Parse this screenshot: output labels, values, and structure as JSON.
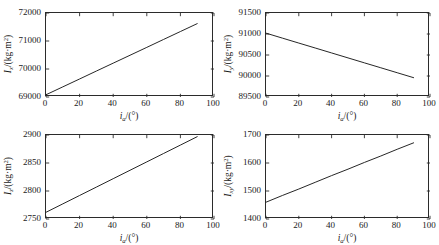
{
  "figure": {
    "background": "#ffffff",
    "line_color": "#1a1a1a",
    "axis_color": "#2b2b2b",
    "panel_count": 4
  },
  "chart_data": [
    {
      "type": "line",
      "panel": "top-left",
      "title": "",
      "xlabel_parts": {
        "symbol": "i",
        "subscript": "a",
        "unit": "/(°)"
      },
      "ylabel_parts": {
        "symbol": "I",
        "subscript": "x",
        "unit": "/(kg·m",
        "exponent": "2",
        "unit_close": ")"
      },
      "xlabel": "i_a/(°)",
      "ylabel": "I_x/(kg·m²)",
      "xlim": [
        0,
        100
      ],
      "ylim": [
        69000,
        72000
      ],
      "xticks": [
        0,
        20,
        40,
        60,
        80,
        100
      ],
      "yticks": [
        69000,
        70000,
        71000,
        72000
      ],
      "xticklabels": [
        "0",
        "20",
        "40",
        "60",
        "80",
        "100"
      ],
      "yticklabels": [
        "69000",
        "70000",
        "71000",
        "72000"
      ],
      "grid": false,
      "legend": null,
      "series": [
        {
          "name": "Ix",
          "x": [
            0,
            10,
            20,
            30,
            40,
            50,
            60,
            70,
            80,
            90
          ],
          "y": [
            69080,
            69362,
            69644,
            69927,
            70209,
            70491,
            70773,
            71056,
            71338,
            71620
          ]
        }
      ]
    },
    {
      "type": "line",
      "panel": "top-right",
      "title": "",
      "xlabel_parts": {
        "symbol": "i",
        "subscript": "a",
        "unit": "/(°)"
      },
      "ylabel_parts": {
        "symbol": "I",
        "subscript": "y",
        "unit": "/(kg·m",
        "exponent": "2",
        "unit_close": ")"
      },
      "xlabel": "i_a/(°)",
      "ylabel": "I_y/(kg·m²)",
      "xlim": [
        0,
        100
      ],
      "ylim": [
        89500,
        91500
      ],
      "xticks": [
        0,
        20,
        40,
        60,
        80,
        100
      ],
      "yticks": [
        89500,
        90000,
        90500,
        91000,
        91500
      ],
      "xticklabels": [
        "0",
        "20",
        "40",
        "60",
        "80",
        "100"
      ],
      "yticklabels": [
        "89500",
        "90000",
        "90500",
        "91000",
        "91500"
      ],
      "grid": false,
      "legend": null,
      "series": [
        {
          "name": "Iy",
          "x": [
            0,
            10,
            20,
            30,
            40,
            50,
            60,
            70,
            80,
            90
          ],
          "y": [
            91020,
            90902,
            90784,
            90667,
            90549,
            90431,
            90313,
            90196,
            90078,
            89960
          ]
        }
      ]
    },
    {
      "type": "line",
      "panel": "bottom-left",
      "title": "",
      "xlabel_parts": {
        "symbol": "i",
        "subscript": "a",
        "unit": "/(°)"
      },
      "ylabel_parts": {
        "symbol": "I",
        "subscript": "z",
        "unit": "/(kg·m",
        "exponent": "2",
        "unit_close": ")"
      },
      "xlabel": "i_a/(°)",
      "ylabel": "I_z/(kg·m²)",
      "xlim": [
        0,
        100
      ],
      "ylim": [
        2750,
        2900
      ],
      "xticks": [
        0,
        20,
        40,
        60,
        80,
        100
      ],
      "yticks": [
        2750,
        2800,
        2850,
        2900
      ],
      "xticklabels": [
        "0",
        "20",
        "40",
        "60",
        "80",
        "100"
      ],
      "yticklabels": [
        "2750",
        "2800",
        "2850",
        "2900"
      ],
      "grid": false,
      "legend": null,
      "series": [
        {
          "name": "Iz",
          "x": [
            0,
            10,
            20,
            30,
            40,
            50,
            60,
            70,
            80,
            90
          ],
          "y": [
            2762,
            2777,
            2792,
            2807,
            2822,
            2837,
            2852,
            2867,
            2882,
            2897
          ]
        }
      ]
    },
    {
      "type": "line",
      "panel": "bottom-right",
      "title": "",
      "xlabel_parts": {
        "symbol": "i",
        "subscript": "a",
        "unit": "/(°)"
      },
      "ylabel_parts": {
        "symbol": "I",
        "subscript": "xy",
        "unit": "/(kg·m",
        "exponent": "2",
        "unit_close": ")"
      },
      "xlabel": "i_a/(°)",
      "ylabel": "I_xy/(kg·m²)",
      "xlim": [
        0,
        100
      ],
      "ylim": [
        1400,
        1700
      ],
      "xticks": [
        0,
        20,
        40,
        60,
        80,
        100
      ],
      "yticks": [
        1400,
        1500,
        1600,
        1700
      ],
      "xticklabels": [
        "0",
        "20",
        "40",
        "60",
        "80",
        "100"
      ],
      "yticklabels": [
        "1400",
        "1500",
        "1600",
        "1700"
      ],
      "grid": false,
      "legend": null,
      "series": [
        {
          "name": "Ixy",
          "x": [
            0,
            10,
            20,
            30,
            40,
            50,
            60,
            70,
            80,
            90
          ],
          "y": [
            1460,
            1484,
            1507,
            1531,
            1555,
            1578,
            1602,
            1625,
            1649,
            1672
          ]
        }
      ]
    }
  ]
}
